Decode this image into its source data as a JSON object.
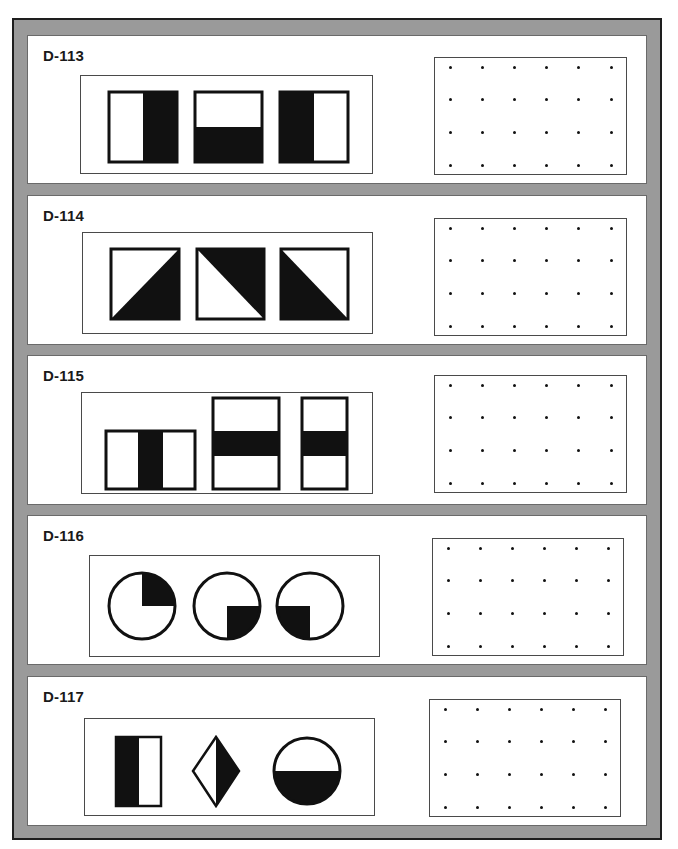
{
  "colors": {
    "frame": "#9a9a9a",
    "frame_border": "#1e1e1e",
    "panel": "#ffffff",
    "fill": "#111111"
  },
  "items": [
    {
      "id": "D-113",
      "shapes": [
        "rect-right-half-black",
        "square-bottom-half-black",
        "rect-left-half-black"
      ]
    },
    {
      "id": "D-114",
      "shapes": [
        "square-lower-right-triangle-black",
        "square-upper-right-triangle-black",
        "square-lower-left-triangle-black"
      ]
    },
    {
      "id": "D-115",
      "shapes": [
        "wide-rect-vertical-center-stripe",
        "tall-rect-horizontal-center-stripe",
        "narrow-rect-horizontal-center-stripe"
      ]
    },
    {
      "id": "D-116",
      "shapes": [
        "circle-top-right-quadrant-black",
        "circle-bottom-right-quadrant-black",
        "circle-bottom-left-quadrant-black"
      ]
    },
    {
      "id": "D-117",
      "shapes": [
        "rect-left-half-black",
        "diamond-right-half-black",
        "circle-bottom-half-black"
      ]
    }
  ],
  "dot_grid": {
    "columns": 6,
    "rows": 4
  }
}
